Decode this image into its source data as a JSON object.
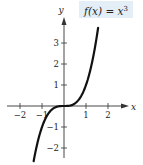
{
  "chart_data": {
    "type": "line",
    "function": "x^3",
    "xlabel": "x",
    "ylabel": "y",
    "xlim": [
      -2.6,
      2.9
    ],
    "ylim": [
      -2.5,
      4.1
    ],
    "x_ticks": [
      -2,
      -1,
      1,
      2
    ],
    "x_tick_labels": [
      "−2",
      "−1",
      "1",
      "2"
    ],
    "y_ticks": [
      -2,
      -1,
      1,
      2,
      3
    ],
    "y_tick_labels": [
      "−2",
      "−1",
      "1",
      "2",
      "3"
    ],
    "grid": false,
    "legend": "none",
    "curve_x_range": [
      -1.38,
      1.55
    ],
    "series": [
      {
        "name": "f(x) = x^3",
        "x": [
          -1.38,
          -1.2,
          -1.0,
          -0.8,
          -0.6,
          -0.4,
          -0.2,
          0,
          0.2,
          0.4,
          0.6,
          0.8,
          1.0,
          1.2,
          1.4,
          1.55
        ],
        "y": [
          -2.63,
          -1.728,
          -1.0,
          -0.512,
          -0.216,
          -0.064,
          -0.008,
          0,
          0.008,
          0.064,
          0.216,
          0.512,
          1.0,
          1.728,
          2.744,
          3.724
        ]
      }
    ]
  },
  "label": {
    "prefix": "f(x) = x",
    "exponent": "3"
  },
  "style": {
    "label_bg": "#e3eef7",
    "curve_color": "#111111",
    "axis_color": "#333333"
  }
}
